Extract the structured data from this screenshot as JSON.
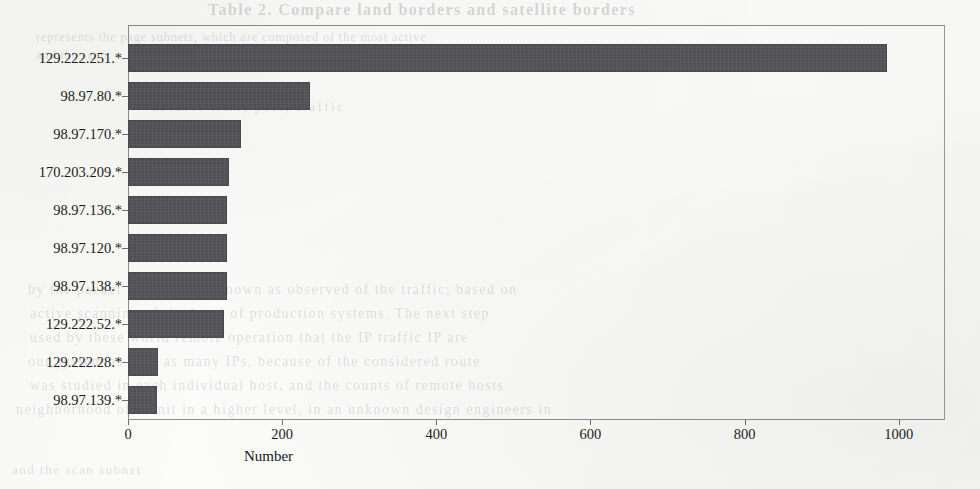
{
  "chart_data": {
    "type": "bar",
    "orientation": "horizontal",
    "title": "",
    "xlabel": "Number",
    "ylabel": "",
    "xlim": [
      0,
      1060
    ],
    "xticks": [
      0,
      200,
      400,
      600,
      800,
      1000
    ],
    "xtick_labels": [
      "0",
      "200",
      "400",
      "600",
      "800",
      "1000"
    ],
    "grid": false,
    "legend": null,
    "bar_color": "#55555a",
    "categories": [
      "129.222.251.*",
      "98.97.80.*",
      "98.97.170.*",
      "170.203.209.*",
      "98.97.136.*",
      "98.97.120.*",
      "98.97.138.*",
      "129.222.52.*",
      "129.222.28.*",
      "98.97.139.*"
    ],
    "values": [
      985,
      236,
      146,
      131,
      129,
      129,
      129,
      124,
      39,
      38
    ]
  },
  "artifacts": {
    "bleed_title": "Table 2. Compare land borders and satellite borders",
    "bleed_lines": [
      "represents the page subnets, which are composed of the most active",
      "and the scan.",
      "nature: time, port, traffic",
      "by the packet availability, known as observed of the traffic; based on",
      "active scanning of the level of production systems. The next step",
      "used by these world remote operation that the IP traffic IP are",
      "our system as well as many IPs, because of the considered route",
      "was studied in each individual host, and the counts of remote hosts",
      "neighborhood of a unit in a higher level, in an unknown design engineers in",
      "and the scan subnet"
    ]
  }
}
